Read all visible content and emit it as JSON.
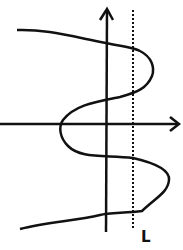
{
  "diagram": {
    "axes": {
      "x_axis": "horizontal arrow",
      "y_axis": "vertical arrow",
      "color": "#111111"
    },
    "curve": {
      "color": "#111111",
      "shape": "S-like curve oscillating horizontally"
    },
    "vertical_line": {
      "label": "L",
      "style": "dotted",
      "color": "#111111"
    }
  }
}
